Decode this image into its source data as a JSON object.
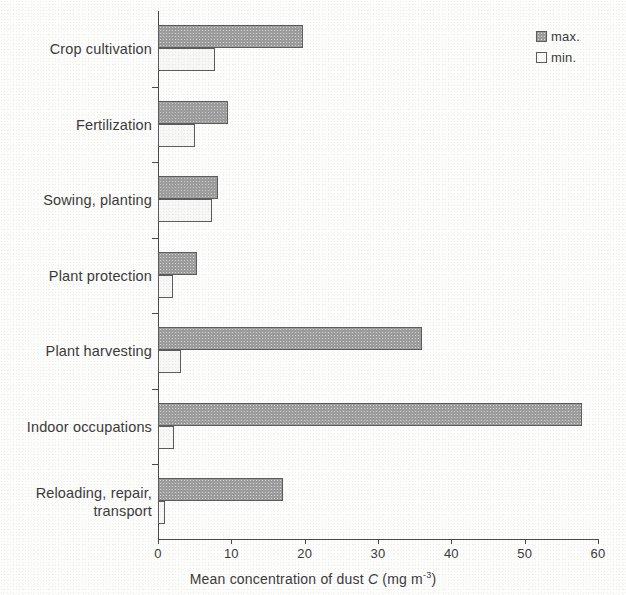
{
  "chart_data": {
    "type": "bar",
    "orientation": "horizontal",
    "title": "",
    "xlabel": "Mean concentration of dust C (mg m-3)",
    "xlabel_prefix": "Mean concentration of dust ",
    "xlabel_italic": "C",
    "xlabel_unit_open": " (mg m",
    "xlabel_unit_exp": "-3",
    "xlabel_unit_close": ")",
    "ylabel": "",
    "categories": [
      "Crop cultivation",
      "Fertilization",
      "Sowing, planting",
      "Plant protection",
      "Plant harvesting",
      "Indoor occupations",
      "Reloading, repair,\ntransport"
    ],
    "series": [
      {
        "name": "max.",
        "values": [
          19.8,
          9.5,
          8.2,
          5.3,
          36.0,
          57.8,
          17.0
        ]
      },
      {
        "name": "min.",
        "values": [
          7.8,
          5.0,
          7.3,
          2.1,
          3.1,
          2.2,
          1.0
        ]
      }
    ],
    "xlim": [
      0,
      60
    ],
    "xticks": [
      0,
      10,
      20,
      30,
      40,
      50,
      60
    ],
    "xtick_labels": [
      "0",
      "10",
      "20",
      "30",
      "40",
      "50",
      "60"
    ],
    "grid": false,
    "legend_position": "top-right",
    "colors": {
      "max_fill": "#9d9d9d",
      "min_fill": "#f7f7f5",
      "bar_border": "#5d5d5d",
      "axis": "#4a4a4a",
      "text": "#3b3b3b",
      "background": "#fdfdfc"
    }
  },
  "legend": {
    "entries": [
      {
        "label": "max.",
        "swatch": "filled-gray-square"
      },
      {
        "label": "min.",
        "swatch": "empty-square"
      }
    ]
  }
}
